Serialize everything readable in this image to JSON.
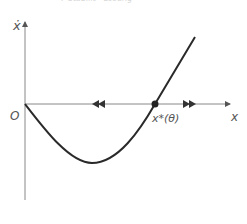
{
  "caption": "7  Stabilit  · Lösung",
  "axes": {
    "y_label": "ẋ",
    "x_label": "x",
    "origin_label": "O"
  },
  "fixed_point": {
    "label": "x*(θ)"
  },
  "colors": {
    "axis": "#777777",
    "curve": "#2a2a2a",
    "label": "#555555"
  },
  "flow": {
    "left_of_fixed_point": "toward fixed point / away leftward",
    "right_of_fixed_point": "rightward"
  }
}
